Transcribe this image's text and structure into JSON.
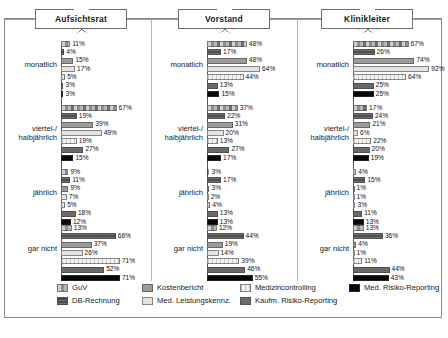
{
  "chart_data": {
    "type": "bar",
    "title": "",
    "xlabel": "",
    "ylabel": "",
    "orientation": "horizontal",
    "xlim": [
      0,
      100
    ],
    "grid": false,
    "legend_position": "bottom",
    "panels": [
      "Aufsichtsrat",
      "Vorstand",
      "Klinikleiter"
    ],
    "categories": [
      "monatlich",
      "viertel-/\nhalbjährlich",
      "jährlich",
      "gar nicht"
    ],
    "series_names": [
      "GuV",
      "DB-Rechnung",
      "Kostenbericht",
      "Med. Leistungskennz.",
      "Medizincontrolling",
      "Kaufm. Risiko-Reporting",
      "Med. Risiko-Reporting"
    ],
    "series_colors": [
      "#a8a8a8",
      "#4e4e4e",
      "#9b9b9b",
      "#f2f2f2",
      "#e3e3e3",
      "#6a6a6a",
      "#080808"
    ],
    "units": "%",
    "data": {
      "Aufsichtsrat": {
        "monatlich": [
          11,
          4,
          15,
          17,
          5,
          3,
          3
        ],
        "viertel-/ halbjährlich": [
          67,
          19,
          39,
          49,
          19,
          27,
          15
        ],
        "jährlich": [
          9,
          11,
          9,
          7,
          5,
          18,
          12
        ],
        "gar nicht": [
          13,
          66,
          37,
          26,
          71,
          52,
          71
        ]
      },
      "Vorstand": {
        "monatlich": [
          48,
          17,
          48,
          64,
          44,
          13,
          15
        ],
        "viertel-/ halbjährlich": [
          37,
          22,
          31,
          20,
          13,
          27,
          17
        ],
        "jährlich": [
          3,
          17,
          3,
          2,
          4,
          13,
          13
        ],
        "gar nicht": [
          12,
          44,
          19,
          14,
          39,
          46,
          55
        ]
      },
      "Klinikleiter": {
        "monatlich": [
          67,
          26,
          74,
          92,
          64,
          25,
          25
        ],
        "viertel-/ halbjährlich": [
          17,
          24,
          21,
          6,
          22,
          20,
          19
        ],
        "jährlich": [
          4,
          15,
          1,
          1,
          3,
          11,
          13
        ],
        "gar nicht": [
          13,
          36,
          4,
          1,
          11,
          44,
          43
        ]
      }
    }
  },
  "legend": {
    "row1": [
      "GuV",
      "Kostenbericht",
      "Medizincontrolling",
      "Med. Risiko-Reporting"
    ],
    "row2": [
      "DB-Rechnung",
      "Med. Leistungskennz.",
      "Kaufm. Risiko-Reporting"
    ]
  }
}
